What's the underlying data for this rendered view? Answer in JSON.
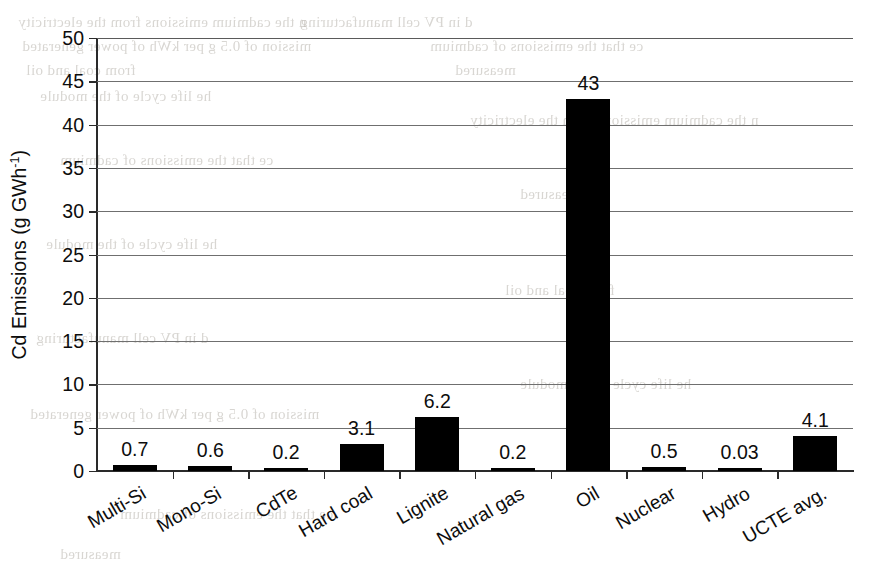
{
  "chart_data": {
    "type": "bar",
    "title": "",
    "xlabel": "",
    "ylabel": "Cd Emissions (g GWh",
    "ylabel_exponent": "-1",
    "ylabel_suffix": ")",
    "categories": [
      "Multi-Si",
      "Mono-Si",
      "CdTe",
      "Hard coal",
      "Lignite",
      "Natural gas",
      "Oil",
      "Nuclear",
      "Hydro",
      "UCTE avg."
    ],
    "values": [
      0.7,
      0.6,
      0.2,
      3.1,
      6.2,
      0.2,
      43,
      0.5,
      0.03,
      4.1
    ],
    "value_labels": [
      "0.7",
      "0.6",
      "0.2",
      "3.1",
      "6.2",
      "0.2",
      "43",
      "0.5",
      "0.03",
      "4.1"
    ],
    "ylim": [
      0,
      50
    ],
    "ytick_labels": [
      "0",
      "5",
      "10",
      "15",
      "20",
      "25",
      "30",
      "35",
      "40",
      "45",
      "50"
    ],
    "ytick_values": [
      0,
      5,
      10,
      15,
      20,
      25,
      30,
      35,
      40,
      45,
      50
    ],
    "grid": true,
    "grid_axis": "y",
    "legend": false,
    "bar_color": "#000000",
    "background_color": "#ffffff",
    "axis_color": "#2a2a2a",
    "gridline_color": "#6f6f6f",
    "label_rotation_deg": -30
  },
  "background_text": {
    "note": "faint show-through text from the reverse side of the scanned page",
    "lines": [
      "n the cadmium emissions from the electricity",
      "d in PV cell manufacturing",
      "mission of 0.5 g per kWh of power generated",
      "ce that the emissions of cadmium",
      "from coal and oil",
      "measured",
      "he life cycle of the module"
    ]
  }
}
